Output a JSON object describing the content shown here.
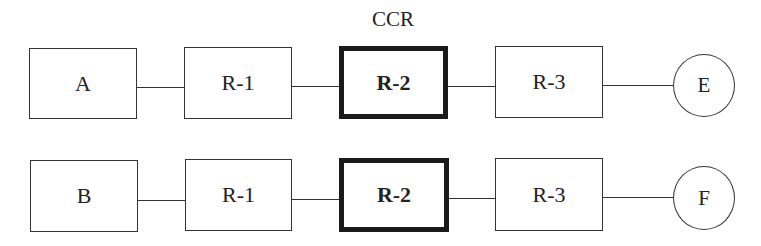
{
  "diagram": {
    "critical_label": "CCR",
    "rows": [
      {
        "source": "A",
        "resources": [
          "R-1",
          "R-2",
          "R-3"
        ],
        "end": "E",
        "critical_index": 1
      },
      {
        "source": "B",
        "resources": [
          "R-1",
          "R-2",
          "R-3"
        ],
        "end": "F",
        "critical_index": 1
      }
    ]
  }
}
